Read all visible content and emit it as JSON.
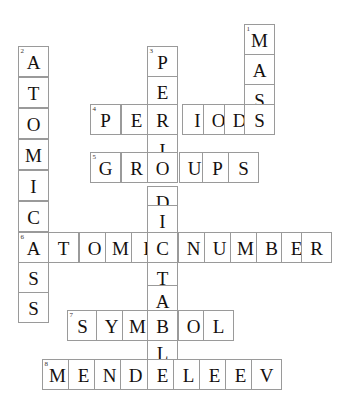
{
  "puzzle": {
    "title": "Chemistry crossword grid",
    "cell_size": 31,
    "border_color": "#9a9a9a",
    "letter_color": "#15100e",
    "background_color": "#ffffff",
    "entries": [
      {
        "number": "1",
        "answer": "MASS",
        "direction": "down",
        "letters": [
          "M",
          "A",
          "S",
          "S"
        ],
        "start": {
          "x": 244,
          "y": 24
        }
      },
      {
        "number": "2",
        "answer": "ATOMICMASS",
        "direction": "down",
        "letters": [
          "A",
          "T",
          "O",
          "M",
          "I",
          "C",
          "M",
          "A",
          "S",
          "S"
        ],
        "start": {
          "x": 18,
          "y": 46
        }
      },
      {
        "number": "3",
        "answer": "PERIODICTABL",
        "direction": "down",
        "letters": [
          "P",
          "E",
          "R",
          "I",
          "O",
          "D",
          "I",
          "C",
          "T",
          "A",
          "B",
          "L"
        ],
        "start": {
          "x": 147,
          "y": 46
        }
      },
      {
        "number": "4",
        "answer": "PERIODS",
        "direction": "across",
        "letters": [
          "P",
          "E",
          "R",
          "I",
          "O",
          "D",
          "S"
        ],
        "start": {
          "x": 90,
          "y": 104
        }
      },
      {
        "number": "5",
        "answer": "GROUPS",
        "direction": "across",
        "letters": [
          "G",
          "R",
          "O",
          "U",
          "P",
          "S"
        ],
        "start": {
          "x": 90,
          "y": 152
        }
      },
      {
        "number": "6",
        "answer": "ATOMICNUMBER",
        "direction": "across",
        "letters": [
          "A",
          "T",
          "O",
          "M",
          "I",
          "C",
          "N",
          "U",
          "M",
          "B",
          "E",
          "R"
        ],
        "start": {
          "x": 18,
          "y": 232
        }
      },
      {
        "number": "7",
        "answer": "SYMBOL",
        "direction": "across",
        "letters": [
          "S",
          "Y",
          "M",
          "B",
          "O",
          "L"
        ],
        "start": {
          "x": 67,
          "y": 310
        }
      },
      {
        "number": "8",
        "answer": "MENDELEEV",
        "direction": "across",
        "letters": [
          "M",
          "E",
          "N",
          "D",
          "E",
          "L",
          "E",
          "E",
          "V"
        ],
        "start": {
          "x": 42,
          "y": 359
        }
      }
    ],
    "cells": [
      {
        "id": "c1-1",
        "letter": "M",
        "num": "1",
        "x": 244,
        "y": 24
      },
      {
        "id": "c1-2",
        "letter": "A",
        "num": "",
        "x": 244,
        "y": 54
      },
      {
        "id": "c1-3",
        "letter": "S",
        "num": "",
        "x": 244,
        "y": 84
      },
      {
        "id": "c2-1",
        "letter": "A",
        "num": "2",
        "x": 18,
        "y": 46
      },
      {
        "id": "c2-2",
        "letter": "T",
        "num": "",
        "x": 18,
        "y": 77
      },
      {
        "id": "c2-3",
        "letter": "O",
        "num": "",
        "x": 18,
        "y": 108
      },
      {
        "id": "c2-4",
        "letter": "M",
        "num": "",
        "x": 18,
        "y": 139
      },
      {
        "id": "c2-5",
        "letter": "I",
        "num": "",
        "x": 18,
        "y": 170
      },
      {
        "id": "c2-6",
        "letter": "C",
        "num": "",
        "x": 18,
        "y": 201
      },
      {
        "id": "c2-7",
        "letter": "M",
        "num": "",
        "x": 18,
        "y": 231
      },
      {
        "id": "c2-9",
        "letter": "S",
        "num": "",
        "x": 18,
        "y": 262
      },
      {
        "id": "c2-10",
        "letter": "S",
        "num": "",
        "x": 18,
        "y": 292
      },
      {
        "id": "c3-1",
        "letter": "P",
        "num": "3",
        "x": 147,
        "y": 46
      },
      {
        "id": "c3-2",
        "letter": "E",
        "num": "",
        "x": 147,
        "y": 76
      },
      {
        "id": "c3-4",
        "letter": "I",
        "num": "",
        "x": 147,
        "y": 134
      },
      {
        "id": "c3-6",
        "letter": "D",
        "num": "",
        "x": 147,
        "y": 186
      },
      {
        "id": "c3-7",
        "letter": "I",
        "num": "",
        "x": 147,
        "y": 205
      },
      {
        "id": "c3-9",
        "letter": "T",
        "num": "",
        "x": 147,
        "y": 262
      },
      {
        "id": "c3-10",
        "letter": "A",
        "num": "",
        "x": 147,
        "y": 285
      },
      {
        "id": "c3-12",
        "letter": "L",
        "num": "",
        "x": 147,
        "y": 337
      },
      {
        "id": "c4-1",
        "letter": "P",
        "num": "4",
        "x": 90,
        "y": 104
      },
      {
        "id": "c4-2",
        "letter": "E",
        "num": "",
        "x": 121,
        "y": 104
      },
      {
        "id": "c4-3",
        "letter": "R",
        "num": "",
        "x": 147,
        "y": 104
      },
      {
        "id": "c4-4",
        "letter": "I",
        "num": "",
        "x": 182,
        "y": 104
      },
      {
        "id": "c4-5",
        "letter": "O",
        "num": "",
        "x": 203,
        "y": 104
      },
      {
        "id": "c4-6",
        "letter": "D",
        "num": "",
        "x": 224,
        "y": 104
      },
      {
        "id": "c4-7",
        "letter": "S",
        "num": "",
        "x": 244,
        "y": 104
      },
      {
        "id": "c5-1",
        "letter": "G",
        "num": "5",
        "x": 90,
        "y": 152
      },
      {
        "id": "c5-2",
        "letter": "R",
        "num": "",
        "x": 121,
        "y": 152
      },
      {
        "id": "c5-3",
        "letter": "O",
        "num": "",
        "x": 147,
        "y": 152
      },
      {
        "id": "c5-4",
        "letter": "U",
        "num": "",
        "x": 179,
        "y": 152
      },
      {
        "id": "c5-5",
        "letter": "P",
        "num": "",
        "x": 202,
        "y": 152
      },
      {
        "id": "c5-6",
        "letter": "S",
        "num": "",
        "x": 228,
        "y": 152
      },
      {
        "id": "c6-1",
        "letter": "A",
        "num": "6",
        "x": 18,
        "y": 232
      },
      {
        "id": "c6-2",
        "letter": "T",
        "num": "",
        "x": 48,
        "y": 232
      },
      {
        "id": "c6-3",
        "letter": "O",
        "num": "",
        "x": 79,
        "y": 232
      },
      {
        "id": "c6-4",
        "letter": "M",
        "num": "",
        "x": 105,
        "y": 232
      },
      {
        "id": "c6-5",
        "letter": "I",
        "num": "",
        "x": 131,
        "y": 232
      },
      {
        "id": "c6-6",
        "letter": "C",
        "num": "",
        "x": 147,
        "y": 232
      },
      {
        "id": "c6-7",
        "letter": "N",
        "num": "",
        "x": 178,
        "y": 232
      },
      {
        "id": "c6-8",
        "letter": "U",
        "num": "",
        "x": 204,
        "y": 232
      },
      {
        "id": "c6-9",
        "letter": "M",
        "num": "",
        "x": 230,
        "y": 232
      },
      {
        "id": "c6-10",
        "letter": "B",
        "num": "",
        "x": 256,
        "y": 232
      },
      {
        "id": "c6-11",
        "letter": "E",
        "num": "",
        "x": 281,
        "y": 232
      },
      {
        "id": "c6-12",
        "letter": "R",
        "num": "",
        "x": 301,
        "y": 232
      },
      {
        "id": "c7-1",
        "letter": "S",
        "num": "7",
        "x": 67,
        "y": 310
      },
      {
        "id": "c7-2",
        "letter": "Y",
        "num": "",
        "x": 96,
        "y": 310
      },
      {
        "id": "c7-3",
        "letter": "M",
        "num": "",
        "x": 122,
        "y": 310
      },
      {
        "id": "c7-4",
        "letter": "B",
        "num": "",
        "x": 147,
        "y": 310
      },
      {
        "id": "c7-5",
        "letter": "O",
        "num": "",
        "x": 178,
        "y": 310
      },
      {
        "id": "c7-6",
        "letter": "L",
        "num": "",
        "x": 203,
        "y": 310
      },
      {
        "id": "c8-1",
        "letter": "M",
        "num": "8",
        "x": 42,
        "y": 359
      },
      {
        "id": "c8-2",
        "letter": "E",
        "num": "",
        "x": 68,
        "y": 359
      },
      {
        "id": "c8-3",
        "letter": "N",
        "num": "",
        "x": 94,
        "y": 359
      },
      {
        "id": "c8-4",
        "letter": "D",
        "num": "",
        "x": 120,
        "y": 359
      },
      {
        "id": "c8-5",
        "letter": "E",
        "num": "",
        "x": 147,
        "y": 359
      },
      {
        "id": "c8-6",
        "letter": "L",
        "num": "",
        "x": 173,
        "y": 359
      },
      {
        "id": "c8-7",
        "letter": "E",
        "num": "",
        "x": 199,
        "y": 359
      },
      {
        "id": "c8-8",
        "letter": "E",
        "num": "",
        "x": 225,
        "y": 359
      },
      {
        "id": "c8-9",
        "letter": "V",
        "num": "",
        "x": 251,
        "y": 359
      }
    ]
  }
}
